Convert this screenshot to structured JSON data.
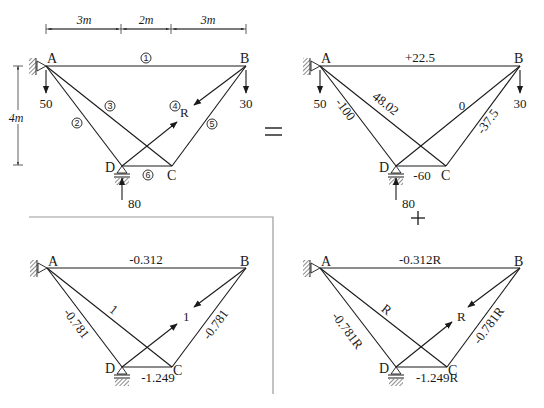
{
  "dimensions": {
    "top": [
      "3m",
      "2m",
      "3m"
    ],
    "side": "4m"
  },
  "operators": {
    "equals": "=",
    "plus": "+"
  },
  "nodes": {
    "A": "A",
    "B": "B",
    "C": "C",
    "D": "D"
  },
  "diagram_original": {
    "loads": {
      "A": "50",
      "B": "30",
      "D_reaction": "80"
    },
    "redundant": "R",
    "member_numbers": [
      "1",
      "2",
      "3",
      "4",
      "5",
      "6"
    ]
  },
  "diagram_primary": {
    "loads": {
      "A": "50",
      "B": "30",
      "D_reaction": "80"
    },
    "forces": {
      "AB": "+22.5",
      "AD": "-100",
      "AC": "48.02",
      "DB": "0",
      "BC": "-37.5",
      "DC": "-60"
    }
  },
  "diagram_unit": {
    "unit_force": "1",
    "forces": {
      "AB": "-0.312",
      "AD": "-0.781",
      "AC": "1",
      "BC": "-0.781",
      "DC": "-1.249"
    }
  },
  "diagram_scaled": {
    "redundant": "R",
    "forces": {
      "AB": "-0.312R",
      "AD": "-0.781R",
      "AC": "R",
      "BC": "-0.781R",
      "DC": "-1.249R"
    }
  },
  "colors": {
    "line": "#1a1a1a",
    "frame": "#9a9a9a",
    "background": "#ffffff"
  }
}
